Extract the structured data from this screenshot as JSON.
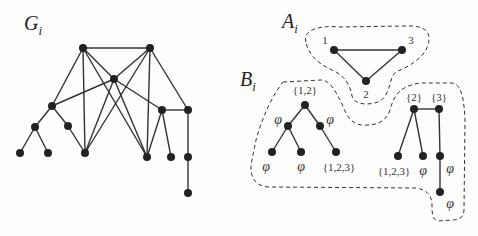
{
  "titles": {
    "g": {
      "main": "G",
      "sub": "i"
    },
    "a": {
      "main": "A",
      "sub": "i"
    },
    "b": {
      "main": "B",
      "sub": "i"
    }
  },
  "colors": {
    "node": "#222222",
    "edge": "#333333",
    "dash": "#333333",
    "background": "#fdfdfc"
  },
  "graph_g": {
    "nodes": [
      {
        "id": "TL",
        "x": 83,
        "y": 48
      },
      {
        "id": "TR",
        "x": 150,
        "y": 48
      },
      {
        "id": "M",
        "x": 114,
        "y": 79
      },
      {
        "id": "L",
        "x": 52,
        "y": 106
      },
      {
        "id": "LL",
        "x": 35,
        "y": 127
      },
      {
        "id": "LR",
        "x": 68,
        "y": 126
      },
      {
        "id": "LLa",
        "x": 20,
        "y": 153
      },
      {
        "id": "LLb",
        "x": 48,
        "y": 153
      },
      {
        "id": "B1",
        "x": 85,
        "y": 153
      },
      {
        "id": "B2",
        "x": 147,
        "y": 157
      },
      {
        "id": "R1",
        "x": 162,
        "y": 110
      },
      {
        "id": "R2",
        "x": 188,
        "y": 110
      },
      {
        "id": "R1a",
        "x": 171,
        "y": 157
      },
      {
        "id": "R2a",
        "x": 188,
        "y": 157
      },
      {
        "id": "R2b",
        "x": 188,
        "y": 193
      }
    ],
    "edges": [
      [
        "TL",
        "TR"
      ],
      [
        "TL",
        "M"
      ],
      [
        "TL",
        "L"
      ],
      [
        "TL",
        "B1"
      ],
      [
        "TL",
        "B2"
      ],
      [
        "TR",
        "M"
      ],
      [
        "TR",
        "B1"
      ],
      [
        "TR",
        "B2"
      ],
      [
        "TR",
        "R2"
      ],
      [
        "M",
        "L"
      ],
      [
        "M",
        "B1"
      ],
      [
        "M",
        "B2"
      ],
      [
        "M",
        "R1"
      ],
      [
        "L",
        "LL"
      ],
      [
        "L",
        "LR"
      ],
      [
        "LL",
        "LLa"
      ],
      [
        "LL",
        "LLb"
      ],
      [
        "LR",
        "B1"
      ],
      [
        "R1",
        "R2"
      ],
      [
        "R1",
        "B2"
      ],
      [
        "R1",
        "R1a"
      ],
      [
        "R2",
        "R2a"
      ],
      [
        "R2a",
        "R2b"
      ]
    ]
  },
  "graph_a": {
    "nodes": [
      {
        "id": "1",
        "x": 334,
        "y": 50,
        "label": "1",
        "lx": 325,
        "ly": 44
      },
      {
        "id": "3",
        "x": 402,
        "y": 50,
        "label": "3",
        "lx": 411,
        "ly": 44
      },
      {
        "id": "2",
        "x": 366,
        "y": 81,
        "label": "2",
        "lx": 366,
        "ly": 98
      }
    ],
    "edges": [
      [
        "1",
        "3"
      ],
      [
        "1",
        "2"
      ],
      [
        "3",
        "2"
      ]
    ]
  },
  "graph_b": {
    "nodes": [
      {
        "id": "a0",
        "x": 305,
        "y": 105,
        "label": "{1,2}",
        "lx": 305,
        "ly": 94
      },
      {
        "id": "a1",
        "x": 288,
        "y": 126,
        "label": "φ",
        "lx": 278,
        "ly": 124
      },
      {
        "id": "a2",
        "x": 320,
        "y": 126,
        "label": "φ",
        "lx": 330,
        "ly": 124
      },
      {
        "id": "a3",
        "x": 272,
        "y": 152,
        "label": "φ",
        "lx": 266,
        "ly": 171
      },
      {
        "id": "a4",
        "x": 301,
        "y": 152,
        "label": "φ",
        "lx": 301,
        "ly": 171
      },
      {
        "id": "a5",
        "x": 336,
        "y": 152,
        "label": "{1,2,3}",
        "lx": 339,
        "ly": 171
      },
      {
        "id": "b0",
        "x": 414,
        "y": 109,
        "label": "{2}",
        "lx": 414,
        "ly": 101
      },
      {
        "id": "b1",
        "x": 439,
        "y": 109,
        "label": "{3}",
        "lx": 439,
        "ly": 101
      },
      {
        "id": "b2",
        "x": 398,
        "y": 156,
        "label": "{1,2,3}",
        "lx": 394,
        "ly": 175
      },
      {
        "id": "b3",
        "x": 423,
        "y": 156,
        "label": "φ",
        "lx": 423,
        "ly": 175
      },
      {
        "id": "b4",
        "x": 440,
        "y": 156,
        "label": "φ",
        "lx": 450,
        "ly": 173
      },
      {
        "id": "b5",
        "x": 440,
        "y": 192,
        "label": "φ",
        "lx": 450,
        "ly": 208
      }
    ],
    "edges": [
      [
        "a0",
        "a1"
      ],
      [
        "a0",
        "a2"
      ],
      [
        "a1",
        "a3"
      ],
      [
        "a1",
        "a4"
      ],
      [
        "a2",
        "a5"
      ],
      [
        "b0",
        "b1"
      ],
      [
        "b0",
        "b2"
      ],
      [
        "b0",
        "b3"
      ],
      [
        "b1",
        "b4"
      ],
      [
        "b4",
        "b5"
      ]
    ]
  },
  "outlines": {
    "a": "M 306 42 C 302 30, 320 25, 340 27 L 405 26 C 425 25, 432 32, 428 45 C 424 58, 410 66, 396 72 C 388 78, 392 95, 378 102 C 366 106, 354 104, 352 96 C 350 86, 346 76, 332 70 C 318 64, 308 54, 306 42 Z",
    "b": "M 283 82 L 321 80 C 330 80, 336 92, 342 104 C 346 114, 350 124, 362 125 C 376 126, 386 122, 390 110 C 394 95, 400 86, 420 83 L 452 83 C 462 84, 464 100, 465 120 L 464 210 C 464 218, 458 220, 452 220 L 438 221 C 432 220, 432 212, 432 206 C 432 196, 428 190, 416 188 L 268 187 C 256 186, 250 178, 251 165 L 256 140 C 262 118, 272 96, 283 82 Z"
  }
}
